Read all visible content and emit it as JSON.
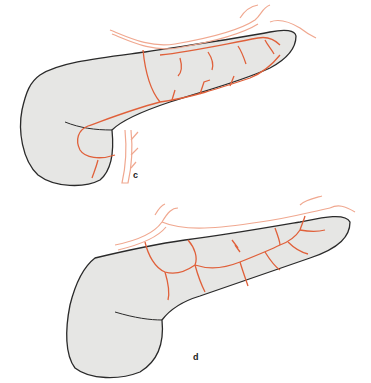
{
  "figure": {
    "panels": [
      {
        "id": "c",
        "label": "c"
      },
      {
        "id": "d",
        "label": "d"
      }
    ],
    "colors": {
      "organ_fill": "#e6e6e4",
      "organ_outline": "#2a2a2a",
      "artery_main": "#e0603a",
      "artery_outer": "#f0a890"
    }
  }
}
